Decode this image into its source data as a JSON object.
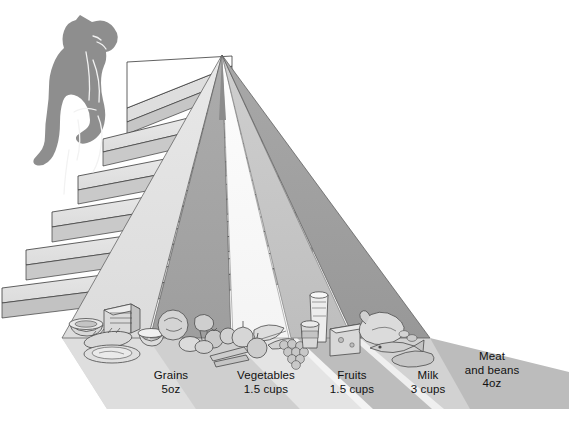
{
  "figure": {
    "type": "diagram",
    "orientation": "landscape",
    "palette": {
      "background": "#ffffff",
      "outline": "#2b2b2b",
      "band_light": "#e2e2e2",
      "band_pale": "#ededed",
      "band_white": "#fbfbfb",
      "band_mid": "#bdbdbd",
      "band_dark": "#a3a3a3",
      "band_darkest": "#9a9a9a",
      "shadow": "#c9c9c9",
      "shadow_dark": "#b0b0b0",
      "stair_tread": "#e6e6e6",
      "stair_riser": "#cfcfcf",
      "stair_side": "#b9b9b9",
      "person_fill": "#8e8e8e",
      "person_line": "#f2f2f2",
      "food_fill": "#d6d6d6",
      "food_shade": "#b5b5b5",
      "food_line": "#4a4a4a"
    }
  },
  "pyramid": {
    "apex": {
      "x": 222,
      "y": 55
    },
    "base_left": {
      "x": 62,
      "y": 338
    },
    "base_right": {
      "x": 430,
      "y": 338
    },
    "bands": [
      {
        "name": "grains-band",
        "tone": "band_light",
        "label_key": "grains"
      },
      {
        "name": "vegetables-band",
        "tone": "band_dark",
        "label_key": "vegetables"
      },
      {
        "name": "fruits-band",
        "tone": "band_white",
        "label_key": "fruits"
      },
      {
        "name": "milk-band",
        "tone": "band_mid",
        "label_key": "milk"
      },
      {
        "name": "meat-band",
        "tone": "band_darkest",
        "label_key": "meat_and_beans"
      }
    ]
  },
  "stairs": {
    "name": "stairway-of-physical-activity",
    "step_count": 6,
    "climber": {
      "name": "person-climbing-stairs",
      "description": "gray silhouette of a person walking up the steps"
    }
  },
  "food_groups": [
    {
      "id": "grains",
      "name": "Grains",
      "amount": "5oz",
      "label_x": 171,
      "label_y": 371,
      "foods": [
        "bread loaf",
        "baguette",
        "cereal bowl",
        "rice bowl",
        "pasta plate"
      ]
    },
    {
      "id": "vegetables",
      "name": "Vegetables",
      "amount": "1.5 cups",
      "label_x": 265,
      "label_y": 371,
      "foods": [
        "lettuce",
        "broccoli",
        "tomatoes",
        "onion",
        "carrots",
        "potatoes"
      ]
    },
    {
      "id": "fruits",
      "name": "Fruits",
      "amount": "1.5 cups",
      "label_x": 352,
      "label_y": 371,
      "foods": [
        "banana",
        "apple",
        "grapes",
        "orange"
      ]
    },
    {
      "id": "milk",
      "name": "Milk",
      "amount": "3 cups",
      "label_x": 428,
      "label_y": 371,
      "foods": [
        "glass of milk",
        "yogurt cup",
        "cheese wedge"
      ]
    },
    {
      "id": "meat_and_beans",
      "name": "Meat and beans",
      "name_line1": "Meat",
      "name_line2": "and beans",
      "amount": "4oz",
      "label_x": 492,
      "label_y": 352,
      "foods": [
        "roast poultry",
        "fish",
        "steak",
        "beans"
      ]
    }
  ],
  "labels": {
    "grains": {
      "line1": "Grains",
      "line2": "5oz"
    },
    "vegetables": {
      "line1": "Vegetables",
      "line2": "1.5 cups"
    },
    "fruits": {
      "line1": "Fruits",
      "line2": "1.5 cups"
    },
    "milk": {
      "line1": "Milk",
      "line2": "3 cups"
    },
    "meat_line1": {
      "line1": "Meat"
    },
    "meat_line2": {
      "line1": "and beans"
    },
    "meat_amount": {
      "line1": "4oz"
    }
  }
}
